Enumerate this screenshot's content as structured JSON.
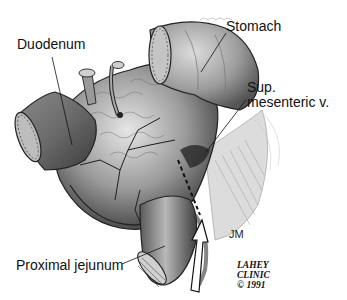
{
  "figure": {
    "type": "anatomical-illustration",
    "labels": [
      {
        "id": "duodenum",
        "text": "Duodenum"
      },
      {
        "id": "stomach",
        "text": "Stomach"
      },
      {
        "id": "sup_mesenteric_1",
        "text": "Sup."
      },
      {
        "id": "sup_mesenteric_2",
        "text": "mesenteric  v."
      },
      {
        "id": "proximal_jejunum",
        "text": "Proximal  jejunum"
      }
    ],
    "artist_initials": "JM",
    "credit": {
      "line1": "LAHEY",
      "line2": "CLINIC",
      "line3": "© 1991"
    }
  },
  "colors": {
    "background": "#ffffff",
    "ink": "#111111",
    "tissue_dark": "#3a3a3a",
    "tissue_mid": "#8a8a8a",
    "tissue_light": "#cfcfcf"
  }
}
